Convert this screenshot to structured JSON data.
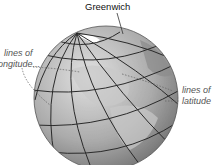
{
  "diagram": {
    "labels": {
      "greenwich": "Greenwich",
      "longitude_line1": "lines of",
      "longitude_line2": "longitude...",
      "latitude_line1": "lines of",
      "latitude_line2": "latitude"
    },
    "colors": {
      "globe_light": "#d8d8d8",
      "globe_mid": "#a8a8a8",
      "globe_dark": "#6e6e6e",
      "grid": "#2a2a2a",
      "leader": "#666666"
    }
  }
}
